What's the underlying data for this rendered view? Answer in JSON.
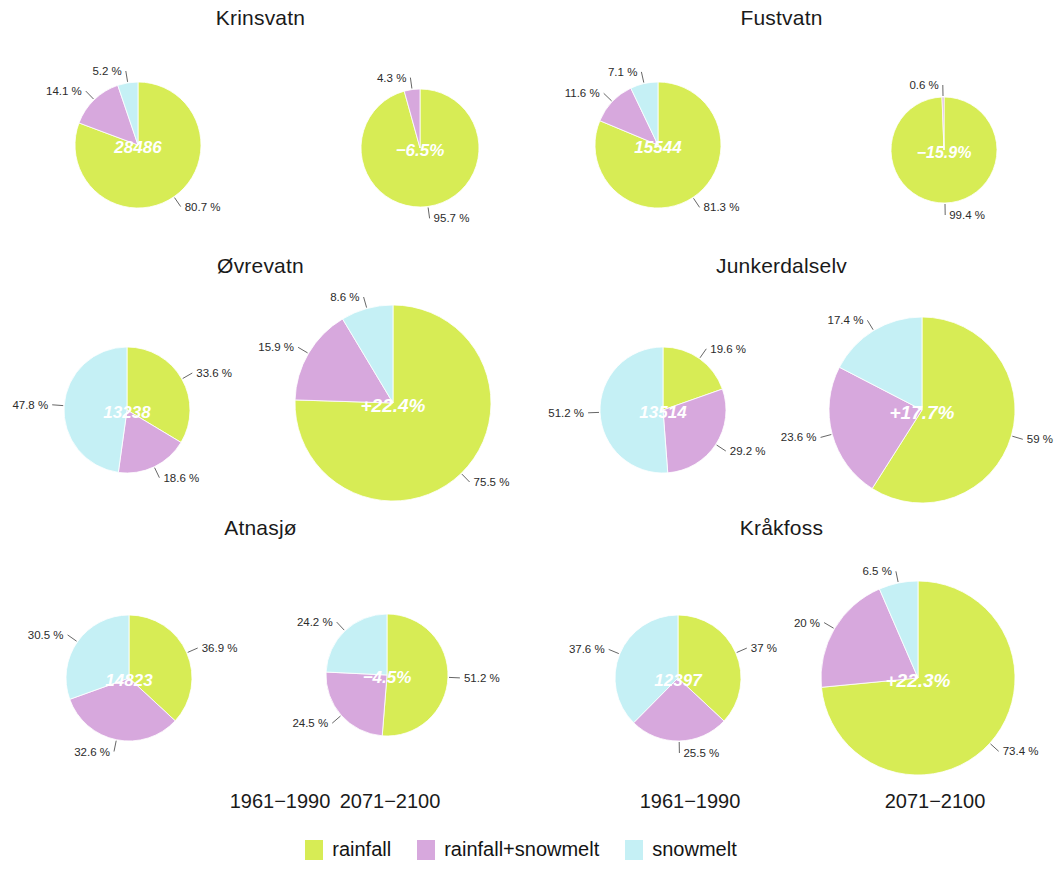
{
  "colors": {
    "rainfall": "#d7ec55",
    "rainfall_snowmelt": "#d7a8dd",
    "snowmelt": "#c5f0f5",
    "label_text": "#2b2b2b",
    "center_text": "#ffffff"
  },
  "legend": {
    "items": [
      {
        "label": "rainfall",
        "key": "rainfall"
      },
      {
        "label": "rainfall+snowmelt",
        "key": "rainfall_snowmelt"
      },
      {
        "label": "snowmelt",
        "key": "snowmelt"
      }
    ]
  },
  "column_labels": [
    {
      "text": "1961−1990"
    },
    {
      "text": "2071−2100"
    },
    {
      "text": "1961−1990"
    },
    {
      "text": "2071−2100"
    }
  ],
  "chart_data": {
    "type": "pie",
    "title": "",
    "legend_position": "bottom",
    "categories": [
      "rainfall",
      "rainfall+snowmelt",
      "snowmelt"
    ],
    "note": "Each station shows two pies: baseline period 1961-1990 with absolute flood magnitude in the centre, and scenario period 2071-2100 with relative change in the centre. Pie radius scales with magnitude. Slices run clockwise from 12 o'clock.",
    "panels": [
      {
        "station": "Krinsvatn",
        "pies": [
          {
            "period": "1961−1990",
            "center_label": "28486",
            "radius": 63,
            "slices": [
              {
                "name": "rainfall",
                "value": 80.7,
                "label": "80.7 %"
              },
              {
                "name": "rainfall+snowmelt",
                "value": 14.1,
                "label": "14.1 %"
              },
              {
                "name": "snowmelt",
                "value": 5.2,
                "label": "5.2 %"
              }
            ]
          },
          {
            "period": "2071−2100",
            "center_label": "−6.5%",
            "radius": 59,
            "slices": [
              {
                "name": "rainfall",
                "value": 95.7,
                "label": "95.7 %"
              },
              {
                "name": "rainfall+snowmelt",
                "value": 4.3,
                "label": "4.3 %"
              },
              {
                "name": "snowmelt",
                "value": 0.0,
                "label": ""
              }
            ]
          }
        ]
      },
      {
        "station": "Fustvatn",
        "pies": [
          {
            "period": "1961−1990",
            "center_label": "15544",
            "radius": 63,
            "slices": [
              {
                "name": "rainfall",
                "value": 81.3,
                "label": "81.3 %"
              },
              {
                "name": "rainfall+snowmelt",
                "value": 11.6,
                "label": "11.6 %"
              },
              {
                "name": "snowmelt",
                "value": 7.1,
                "label": "7.1 %"
              }
            ]
          },
          {
            "period": "2071−2100",
            "center_label": "−15.9%",
            "radius": 53,
            "slices": [
              {
                "name": "rainfall",
                "value": 99.4,
                "label": "99.4 %"
              },
              {
                "name": "rainfall+snowmelt",
                "value": 0.6,
                "label": "0.6 %"
              },
              {
                "name": "snowmelt",
                "value": 0.0,
                "label": ""
              }
            ]
          }
        ]
      },
      {
        "station": "Øvrevatn",
        "pies": [
          {
            "period": "1961−1990",
            "center_label": "13238",
            "radius": 63,
            "slices": [
              {
                "name": "rainfall",
                "value": 33.6,
                "label": "33.6 %"
              },
              {
                "name": "rainfall+snowmelt",
                "value": 18.6,
                "label": "18.6 %"
              },
              {
                "name": "snowmelt",
                "value": 47.8,
                "label": "47.8 %"
              }
            ]
          },
          {
            "period": "2071−2100",
            "center_label": "+22.4%",
            "radius": 98,
            "slices": [
              {
                "name": "rainfall",
                "value": 75.5,
                "label": "75.5 %"
              },
              {
                "name": "rainfall+snowmelt",
                "value": 15.9,
                "label": "15.9 %"
              },
              {
                "name": "snowmelt",
                "value": 8.6,
                "label": "8.6 %"
              }
            ]
          }
        ]
      },
      {
        "station": "Junkerdalselv",
        "pies": [
          {
            "period": "1961−1990",
            "center_label": "13514",
            "radius": 63,
            "slices": [
              {
                "name": "rainfall",
                "value": 19.6,
                "label": "19.6 %"
              },
              {
                "name": "rainfall+snowmelt",
                "value": 29.2,
                "label": "29.2 %"
              },
              {
                "name": "snowmelt",
                "value": 51.2,
                "label": "51.2 %"
              }
            ]
          },
          {
            "period": "2071−2100",
            "center_label": "+17.7%",
            "radius": 93,
            "slices": [
              {
                "name": "rainfall",
                "value": 59.0,
                "label": "59 %"
              },
              {
                "name": "rainfall+snowmelt",
                "value": 23.6,
                "label": "23.6 %"
              },
              {
                "name": "snowmelt",
                "value": 17.4,
                "label": "17.4 %"
              }
            ]
          }
        ]
      },
      {
        "station": "Atnasjø",
        "pies": [
          {
            "period": "1961−1990",
            "center_label": "14823",
            "radius": 63,
            "slices": [
              {
                "name": "rainfall",
                "value": 36.9,
                "label": "36.9 %"
              },
              {
                "name": "rainfall+snowmelt",
                "value": 32.6,
                "label": "32.6 %"
              },
              {
                "name": "snowmelt",
                "value": 30.5,
                "label": "30.5 %"
              }
            ]
          },
          {
            "period": "2071−2100",
            "center_label": "−4.5%",
            "radius": 61,
            "slices": [
              {
                "name": "rainfall",
                "value": 51.2,
                "label": "51.2 %"
              },
              {
                "name": "rainfall+snowmelt",
                "value": 24.5,
                "label": "24.5 %"
              },
              {
                "name": "snowmelt",
                "value": 24.2,
                "label": "24.2 %"
              }
            ]
          }
        ]
      },
      {
        "station": "Kråkfoss",
        "pies": [
          {
            "period": "1961−1990",
            "center_label": "12397",
            "radius": 63,
            "slices": [
              {
                "name": "rainfall",
                "value": 37.0,
                "label": "37 %"
              },
              {
                "name": "rainfall+snowmelt",
                "value": 25.5,
                "label": "25.5 %"
              },
              {
                "name": "snowmelt",
                "value": 37.6,
                "label": "37.6 %"
              }
            ]
          },
          {
            "period": "2071−2100",
            "center_label": "+22.3%",
            "radius": 97,
            "slices": [
              {
                "name": "rainfall",
                "value": 73.4,
                "label": "73.4 %"
              },
              {
                "name": "rainfall+snowmelt",
                "value": 20.0,
                "label": "20 %"
              },
              {
                "name": "snowmelt",
                "value": 6.5,
                "label": "6.5 %"
              }
            ]
          }
        ]
      }
    ]
  },
  "layout": {
    "panels": [
      {
        "title_x": 0,
        "title_y": 6,
        "title_w": 521,
        "pies": [
          {
            "cx": 138,
            "cy": 145,
            "fs": 17
          },
          {
            "cx": 420,
            "cy": 148,
            "fs": 17
          }
        ]
      },
      {
        "title_x": 521,
        "title_y": 6,
        "title_w": 521,
        "pies": [
          {
            "cx": 658,
            "cy": 145,
            "fs": 17
          },
          {
            "cx": 944,
            "cy": 150,
            "fs": 16
          }
        ]
      },
      {
        "title_x": 0,
        "title_y": 254,
        "title_w": 521,
        "pies": [
          {
            "cx": 127,
            "cy": 410,
            "fs": 17
          },
          {
            "cx": 393,
            "cy": 403,
            "fs": 19
          }
        ]
      },
      {
        "title_x": 521,
        "title_y": 254,
        "title_w": 521,
        "pies": [
          {
            "cx": 663,
            "cy": 410,
            "fs": 17
          },
          {
            "cx": 922,
            "cy": 410,
            "fs": 19
          }
        ]
      },
      {
        "title_x": 0,
        "title_y": 516,
        "title_w": 521,
        "pies": [
          {
            "cx": 129,
            "cy": 678,
            "fs": 17
          },
          {
            "cx": 387,
            "cy": 675,
            "fs": 17
          }
        ]
      },
      {
        "title_x": 521,
        "title_y": 516,
        "title_w": 521,
        "pies": [
          {
            "cx": 678,
            "cy": 678,
            "fs": 17
          },
          {
            "cx": 918,
            "cy": 678,
            "fs": 19
          }
        ]
      }
    ],
    "column_labels": [
      {
        "x": 190,
        "y": 790,
        "w": 180
      },
      {
        "x": 300,
        "y": 790,
        "w": 180
      },
      {
        "x": 600,
        "y": 790,
        "w": 180
      },
      {
        "x": 845,
        "y": 790,
        "w": 180
      }
    ]
  }
}
